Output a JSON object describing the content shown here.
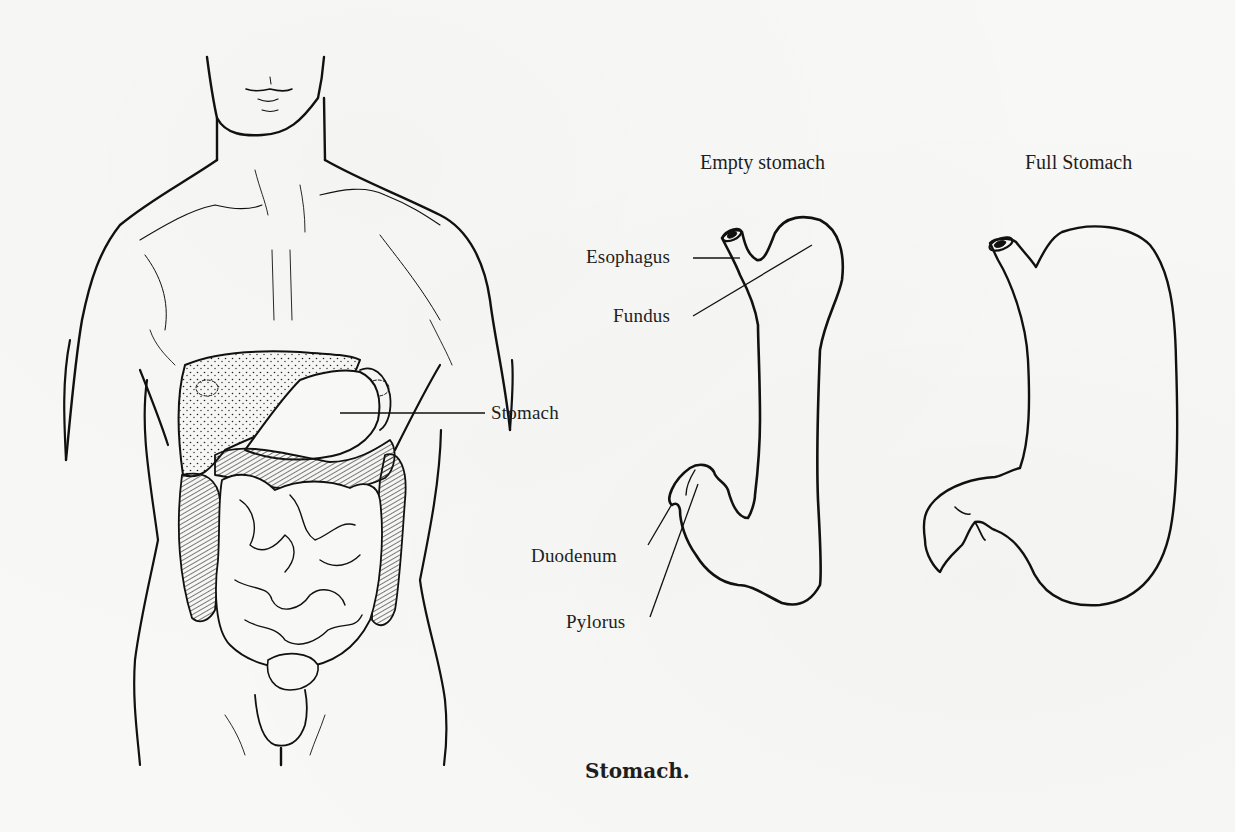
{
  "figure": {
    "caption": "Stomach.",
    "panels": {
      "body": {
        "label_stomach": "Stomach"
      },
      "empty": {
        "title": "Empty stomach",
        "labels": {
          "esophagus": "Esophagus",
          "fundus": "Fundus",
          "duodenum": "Duodenum",
          "pylorus": "Pylorus"
        }
      },
      "full": {
        "title": "Full Stomach"
      }
    }
  },
  "colors": {
    "ink": "#111111",
    "paper": "#f8f8f6"
  }
}
